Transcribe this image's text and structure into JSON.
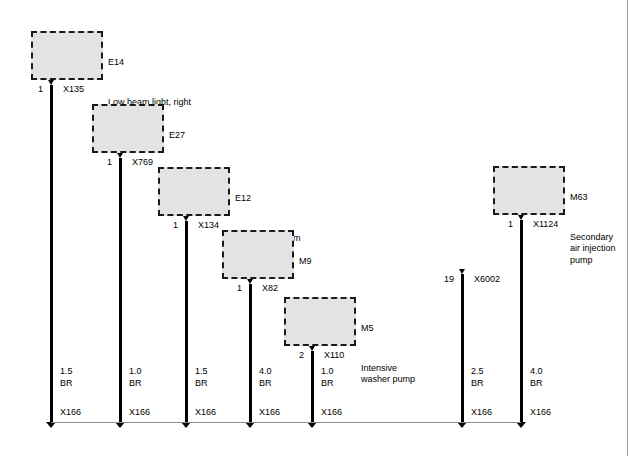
{
  "diagram": {
    "ground_bus_label": "X166",
    "components": [
      {
        "code": "E14",
        "description": "Low beam light, right",
        "pin": "1",
        "connector": "X769_placeholder"
      }
    ],
    "branches": [
      {
        "code": "E14",
        "description": "Low beam light, right",
        "pin": "1",
        "connector": "X135",
        "wire_size": "1.5",
        "wire_color": "BR",
        "ground": "X166"
      },
      {
        "code": "E27",
        "description": "Right fog light",
        "pin": "1",
        "connector": "X769",
        "wire_size": "1.0",
        "wire_color": "BR",
        "ground": "X166"
      },
      {
        "code": "E12",
        "description": "Right high beam",
        "pin": "1",
        "connector": "X134",
        "wire_size": "1.5",
        "wire_color": "BR",
        "ground": "X166"
      },
      {
        "code": "M9",
        "description": "Electric  fan",
        "pin": "1",
        "connector": "X82",
        "wire_size": "4.0",
        "wire_color": "BR",
        "ground": "X166"
      },
      {
        "code": "M5",
        "description": "Intensive\nwasher pump",
        "pin": "2",
        "connector": "X110",
        "wire_size": "1.0",
        "wire_color": "BR",
        "ground": "X166"
      },
      {
        "code": "",
        "description": "",
        "pin": "19",
        "connector": "X6002",
        "wire_size": "2.5",
        "wire_color": "BR",
        "ground": "X166"
      },
      {
        "code": "M63",
        "description": "Secondary\nair injection\npump",
        "pin": "1",
        "connector": "X1124",
        "wire_size": "4.0",
        "wire_color": "BR",
        "ground": "X166"
      }
    ]
  },
  "colors": {
    "box_fill": "#e3e3e3",
    "box_border": "#1a1a1a",
    "wire": "#000000",
    "bus": "#8e8e8e",
    "page_border": "#9a9a9a"
  }
}
